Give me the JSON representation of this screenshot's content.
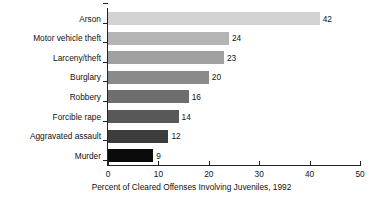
{
  "chart_data": {
    "type": "bar",
    "orientation": "horizontal",
    "title": "",
    "xlabel": "Percent of Cleared Offenses Involving Juveniles, 1992",
    "ylabel": "",
    "categories": [
      "Arson",
      "Motor vehicle theft",
      "Larceny/theft",
      "Burglary",
      "Robbery",
      "Forcible rape",
      "Aggravated assault",
      "Murder"
    ],
    "values": [
      42,
      24,
      23,
      20,
      16,
      14,
      12,
      9
    ],
    "value_labels": [
      "42",
      "24",
      "23",
      "20",
      "16",
      "14",
      "12",
      "9"
    ],
    "bar_colors": [
      "#d2d2d2",
      "#b4b4b4",
      "#a0a0a0",
      "#8a8a8a",
      "#6e6e6e",
      "#585858",
      "#3c3c3c",
      "#0a0a0a"
    ],
    "xlim": [
      0,
      50
    ],
    "xticks": [
      0,
      10,
      20,
      30,
      40,
      50
    ],
    "xtick_labels": [
      "0",
      "10",
      "20",
      "30",
      "40",
      "50"
    ],
    "grid": false,
    "legend": null
  }
}
